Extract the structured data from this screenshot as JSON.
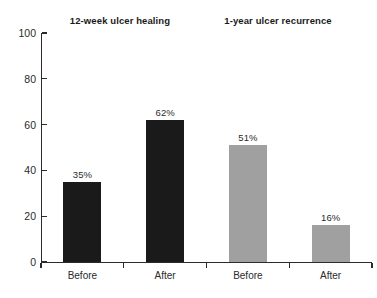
{
  "chart_data": {
    "type": "bar",
    "title": "",
    "xlabel": "",
    "ylabel": "",
    "ylim": [
      0,
      100
    ],
    "yticks": [
      0,
      20,
      40,
      60,
      80,
      100
    ],
    "ytick_labels": [
      "0",
      "20",
      "40",
      "60",
      "80",
      "100"
    ],
    "grid": false,
    "legend": null,
    "categories": [
      "Before",
      "After",
      "Before",
      "After"
    ],
    "values": [
      35,
      62,
      51,
      16
    ],
    "value_labels": [
      "35%",
      "62%",
      "51%",
      "16%"
    ],
    "bar_colors": [
      "#1a1a1a",
      "#1a1a1a",
      "#a0a0a0",
      "#a0a0a0"
    ],
    "groups": [
      {
        "title": "12-week ulcer healing",
        "categories": [
          "Before",
          "After"
        ],
        "values": [
          35,
          62
        ],
        "value_labels": [
          "35%",
          "62%"
        ],
        "color": "#1a1a1a"
      },
      {
        "title": "1-year ulcer recurrence",
        "categories": [
          "Before",
          "After"
        ],
        "values": [
          51,
          16
        ],
        "value_labels": [
          "51%",
          "16%"
        ],
        "color": "#a0a0a0"
      }
    ],
    "bars": [
      {
        "label": "Before",
        "value": 35,
        "value_label": "35%",
        "color": "#1a1a1a",
        "group": "12-week ulcer healing"
      },
      {
        "label": "After",
        "value": 62,
        "value_label": "62%",
        "color": "#1a1a1a",
        "group": "12-week ulcer healing"
      },
      {
        "label": "Before",
        "value": 51,
        "value_label": "51%",
        "color": "#a0a0a0",
        "group": "1-year ulcer recurrence"
      },
      {
        "label": "After",
        "value": 16,
        "value_label": "16%",
        "color": "#a0a0a0",
        "group": "1-year ulcer recurrence"
      }
    ],
    "axis_color": "#2b2b2b",
    "background": "#ffffff"
  }
}
